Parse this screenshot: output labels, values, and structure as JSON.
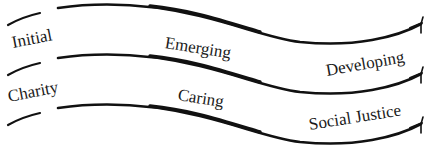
{
  "diagram": {
    "rows": [
      {
        "labels": [
          {
            "text": "Initial"
          },
          {
            "text": "Emerging"
          },
          {
            "text": "Developing"
          }
        ]
      },
      {
        "labels": [
          {
            "text": "Charity"
          },
          {
            "text": "Caring"
          },
          {
            "text": "Social Justice"
          }
        ]
      }
    ],
    "lines": [
      {
        "name": "top-ribbon-line"
      },
      {
        "name": "middle-ribbon-line"
      },
      {
        "name": "bottom-ribbon-line"
      }
    ],
    "colors": {
      "line": "#111111",
      "text": "#1a1a1a",
      "background": "#ffffff"
    }
  }
}
